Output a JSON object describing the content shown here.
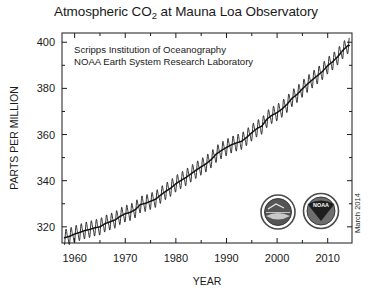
{
  "title": {
    "prefix": "Atmospheric CO",
    "subscript": "2",
    "suffix": " at Mauna Loa Observatory",
    "full": "Atmospheric CO2 at Mauna Loa Observatory"
  },
  "annotations": {
    "line1": "Scripps Institution of Oceanography",
    "line2": "NOAA Earth System Research Laboratory",
    "date_stamp": "March 2014"
  },
  "logos": {
    "scripps": {
      "name": "scripps-institution-seal",
      "label": ""
    },
    "noaa": {
      "name": "noaa-seal",
      "label": "NOAA"
    }
  },
  "colors": {
    "ink": "#1a1a1a",
    "line": "#111111",
    "background": "#ffffff",
    "logo_dark": "#3a3a3a"
  },
  "chart_data": {
    "type": "line",
    "title": "Atmospheric CO2 at Mauna Loa Observatory",
    "xlabel": "YEAR",
    "ylabel": "PARTS PER MILLION",
    "xlim": [
      1957.5,
      2014.8
    ],
    "ylim": [
      313,
      404
    ],
    "grid": false,
    "legend": "none",
    "x_ticks": [
      1960,
      1970,
      1980,
      1990,
      2000,
      2010
    ],
    "y_ticks": [
      320,
      340,
      360,
      380,
      400
    ],
    "y_minor_ticks": [
      330,
      350,
      370,
      390
    ],
    "x_minor_ticks": [
      1965,
      1975,
      1985,
      1995,
      2005
    ],
    "seasonal_amplitude_ppm": 6.2,
    "series": [
      {
        "name": "Monthly mean CO2 (seasonal cycle)",
        "style": "sawtooth-oscillation"
      },
      {
        "name": "Seasonally corrected trend",
        "style": "smooth-trend"
      }
    ],
    "x": [
      1958,
      1959,
      1960,
      1961,
      1962,
      1963,
      1964,
      1965,
      1966,
      1967,
      1968,
      1969,
      1970,
      1971,
      1972,
      1973,
      1974,
      1975,
      1976,
      1977,
      1978,
      1979,
      1980,
      1981,
      1982,
      1983,
      1984,
      1985,
      1986,
      1987,
      1988,
      1989,
      1990,
      1991,
      1992,
      1993,
      1994,
      1995,
      1996,
      1997,
      1998,
      1999,
      2000,
      2001,
      2002,
      2003,
      2004,
      2005,
      2006,
      2007,
      2008,
      2009,
      2010,
      2011,
      2012,
      2013,
      2014
    ],
    "values": [
      315.3,
      315.9,
      316.9,
      317.6,
      318.4,
      318.9,
      319.6,
      320.0,
      321.4,
      322.2,
      323.0,
      324.6,
      325.7,
      326.3,
      327.5,
      329.7,
      330.2,
      331.1,
      332.0,
      333.8,
      335.4,
      336.8,
      338.7,
      340.1,
      341.4,
      343.0,
      344.6,
      346.0,
      347.4,
      349.2,
      351.6,
      353.1,
      354.4,
      355.6,
      356.4,
      357.1,
      358.8,
      360.8,
      362.6,
      363.7,
      366.7,
      368.4,
      369.5,
      371.1,
      373.2,
      375.8,
      377.5,
      379.8,
      381.9,
      383.8,
      385.6,
      387.4,
      389.9,
      391.6,
      393.8,
      396.5,
      398.6
    ]
  }
}
